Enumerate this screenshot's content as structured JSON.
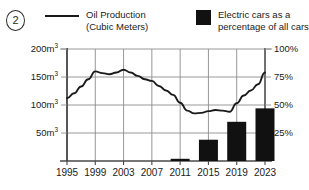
{
  "figure": {
    "marker_label": "2"
  },
  "legend": {
    "series": [
      {
        "name": "oil-production",
        "swatch": "line-swatch",
        "lines": [
          "Oil Production",
          "(Cubic Meters)"
        ],
        "color": "#1a1a1a"
      },
      {
        "name": "electric-cars",
        "swatch": "bar-swatch",
        "lines": [
          "Electric cars as a",
          "percentage of all cars sold."
        ],
        "color": "#111111"
      }
    ]
  },
  "axes": {
    "left_ticks": [
      {
        "value": 200,
        "label": "200m",
        "unit": "3"
      },
      {
        "value": 150,
        "label": "150m",
        "unit": "3"
      },
      {
        "value": 100,
        "label": "100m",
        "unit": "3"
      },
      {
        "value": 50,
        "label": "50m",
        "unit": "3"
      }
    ],
    "right_ticks": [
      {
        "value": 100,
        "label": "100%"
      },
      {
        "value": 75,
        "label": "75%"
      },
      {
        "value": 50,
        "label": "50%"
      },
      {
        "value": 25,
        "label": "25%"
      }
    ],
    "x_ticks": [
      "1995",
      "1999",
      "2003",
      "2007",
      "2011",
      "2015",
      "2019",
      "2023"
    ]
  },
  "chart_data": {
    "type": "line",
    "title": "",
    "subtitle": "",
    "xlabel": "",
    "ylabel": "Oil Production (Cubic Meters)",
    "y2label": "Electric cars as a percentage of all cars sold.",
    "grid": true,
    "legend_position": "top",
    "xlim": [
      1995,
      2023
    ],
    "ylim": [
      0,
      200
    ],
    "y2lim": [
      0,
      100
    ],
    "x_tick_values": [
      1995,
      1999,
      2003,
      2007,
      2011,
      2015,
      2019,
      2023
    ],
    "y_tick_values": [
      50,
      100,
      150,
      200
    ],
    "y2_tick_values": [
      25,
      50,
      75,
      100
    ],
    "series": [
      {
        "name": "Oil Production (Cubic Meters)",
        "type": "line",
        "axis": "left",
        "color": "#1a1a1a",
        "x": [
          1995,
          1996,
          1997,
          1998,
          1999,
          2000,
          2001,
          2002,
          2003,
          2004,
          2005,
          2006,
          2007,
          2008,
          2009,
          2010,
          2011,
          2012,
          2013,
          2014,
          2015,
          2016,
          2017,
          2018,
          2019,
          2020,
          2021,
          2022,
          2023
        ],
        "values": [
          112,
          121,
          133,
          146,
          160,
          157,
          155,
          158,
          163,
          158,
          152,
          146,
          143,
          134,
          126,
          118,
          104,
          90,
          85,
          86,
          89,
          91,
          90,
          88,
          103,
          117,
          126,
          137,
          158
        ]
      },
      {
        "name": "Electric cars as a percentage of all cars sold.",
        "type": "bar",
        "axis": "right",
        "color": "#111111",
        "categories": [
          "2011",
          "2015",
          "2019",
          "2023"
        ],
        "x": [
          2011,
          2015,
          2019,
          2023
        ],
        "values": [
          1,
          19,
          35,
          47
        ]
      }
    ]
  }
}
